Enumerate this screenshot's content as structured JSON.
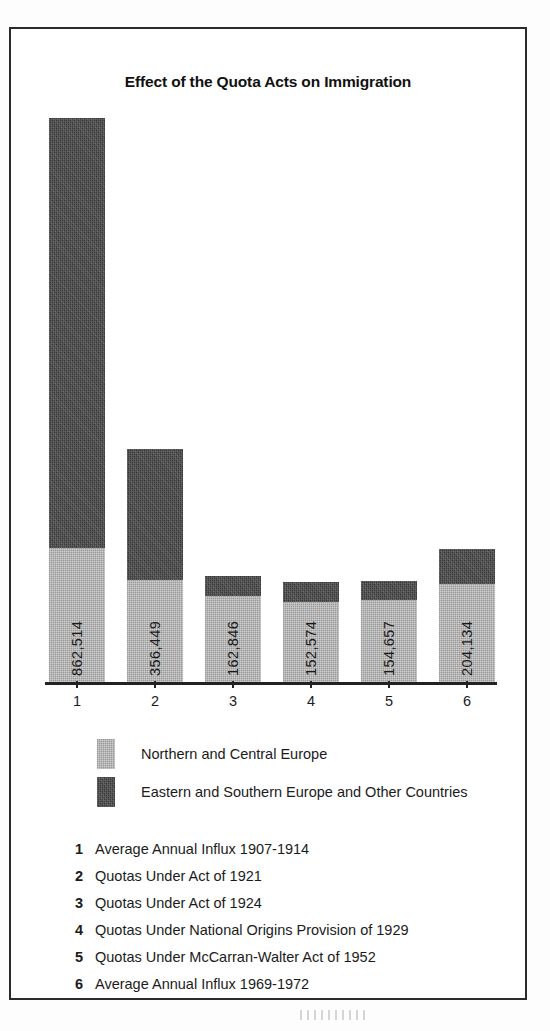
{
  "chart_data": {
    "type": "bar",
    "subtype": "stacked-column",
    "title": "Effect of the Quota Acts on Immigration",
    "xlabel": "",
    "ylabel": "",
    "categories": [
      "1",
      "2",
      "3",
      "4",
      "5",
      "6"
    ],
    "value_labels": [
      "862,514",
      "356,449",
      "162,846",
      "152,574",
      "154,657",
      "204,134"
    ],
    "totals": [
      862514,
      356449,
      162846,
      152574,
      154657,
      204134
    ],
    "series": [
      {
        "name": "Northern and Central Europe",
        "color": "#a9a9a9",
        "values": [
          205000,
          156000,
          131000,
          123000,
          125000,
          150000
        ]
      },
      {
        "name": "Eastern and Southern Europe and Other Countries",
        "color": "#373737",
        "values": [
          657514,
          200449,
          31846,
          29574,
          29657,
          54134
        ]
      }
    ],
    "ylim": [
      0,
      880000
    ],
    "grid": false,
    "legend_position": "below-plot"
  },
  "chart": {
    "title": "Effect of the Quota Acts on Immigration",
    "axis": {
      "tick_labels": [
        "1",
        "2",
        "3",
        "4",
        "5",
        "6"
      ]
    },
    "bars": [
      {
        "category": "1",
        "value_label": "862,514"
      },
      {
        "category": "2",
        "value_label": "356,449"
      },
      {
        "category": "3",
        "value_label": "162,846"
      },
      {
        "category": "4",
        "value_label": "152,574"
      },
      {
        "category": "5",
        "value_label": "154,657"
      },
      {
        "category": "6",
        "value_label": "204,134"
      }
    ]
  },
  "legend": {
    "entries": [
      {
        "label": "Northern and Central Europe",
        "color": "#a9a9a9"
      },
      {
        "label": "Eastern and Southern Europe and Other Countries",
        "color": "#373737"
      }
    ]
  },
  "key": {
    "items": [
      {
        "num": "1",
        "text": "Average Annual Influx 1907-1914"
      },
      {
        "num": "2",
        "text": "Quotas Under Act of 1921"
      },
      {
        "num": "3",
        "text": "Quotas Under Act of 1924"
      },
      {
        "num": "4",
        "text": "Quotas Under National Origins Provision of 1929"
      },
      {
        "num": "5",
        "text": "Quotas Under McCarran-Walter Act of 1952"
      },
      {
        "num": "6",
        "text": "Average Annual Influx 1969-1972"
      }
    ]
  }
}
